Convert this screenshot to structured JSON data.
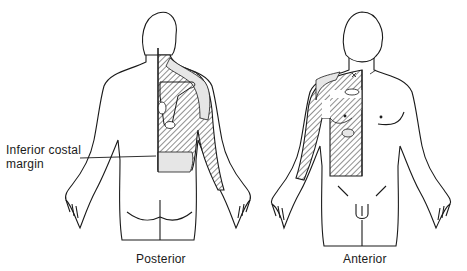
{
  "diagram": {
    "figures": [
      {
        "id": "posterior",
        "caption": "Posterior"
      },
      {
        "id": "anterior",
        "caption": "Anterior"
      }
    ],
    "annotations": [
      {
        "id": "inferior-costal-margin",
        "text_line1": "Inferior costal",
        "text_line2": "margin"
      }
    ],
    "colors": {
      "line": "#1a1a1a",
      "shade": "#e6e6e6",
      "background": "#ffffff"
    }
  }
}
